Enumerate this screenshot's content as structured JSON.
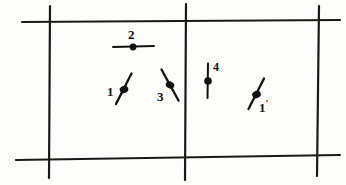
{
  "figure": {
    "title": "",
    "background_color": "#fdfdfc",
    "ink_color": "#1a1a1a",
    "width": 346,
    "height": 185
  },
  "grid": {
    "description": "Hand-drawn rectangular grid of two horizontal rules crossed by three vertical rules",
    "horizontal_lines": [
      {
        "name": "top-horizontal-line",
        "x1": 22,
        "y1": 22,
        "x2": 340,
        "y2": 20
      },
      {
        "name": "bottom-horizontal-line",
        "x1": 16,
        "y1": 160,
        "x2": 340,
        "y2": 155
      }
    ],
    "vertical_lines": [
      {
        "name": "left-vertical-line",
        "x1": 50,
        "y1": 6,
        "x2": 49,
        "y2": 178
      },
      {
        "name": "middle-vertical-line",
        "x1": 186,
        "y1": 4,
        "x2": 185,
        "y2": 180
      },
      {
        "name": "right-vertical-line",
        "x1": 319,
        "y1": 6,
        "x2": 317,
        "y2": 176
      }
    ]
  },
  "markers": [
    {
      "id": "marker-2",
      "label": "2",
      "orientation": "horizontal",
      "angle_deg": 90,
      "dot": {
        "cx": 133,
        "cy": 47
      },
      "stroke": {
        "x1": 113,
        "y1": 47,
        "x2": 154,
        "y2": 46
      },
      "label_pos": {
        "x": 128,
        "y": 28
      }
    },
    {
      "id": "marker-1",
      "label": "1",
      "orientation": "tilted-right",
      "angle_deg": 25,
      "dot": {
        "cx": 124,
        "cy": 90
      },
      "stroke": {
        "x1": 131,
        "y1": 74,
        "x2": 116,
        "y2": 104
      },
      "label_pos": {
        "x": 107,
        "y": 85
      }
    },
    {
      "id": "marker-3",
      "label": "3",
      "orientation": "tilted-left",
      "angle_deg": -25,
      "dot": {
        "cx": 170,
        "cy": 86
      },
      "stroke": {
        "x1": 162,
        "y1": 70,
        "x2": 178,
        "y2": 100
      },
      "label_pos": {
        "x": 158,
        "y": 90
      }
    },
    {
      "id": "marker-4",
      "label": "4",
      "orientation": "vertical",
      "angle_deg": 0,
      "dot": {
        "cx": 208,
        "cy": 81
      },
      "stroke": {
        "x1": 208,
        "y1": 64,
        "x2": 208,
        "y2": 98
      },
      "label_pos": {
        "x": 213,
        "y": 62
      }
    },
    {
      "id": "marker-1-prime",
      "label": "1",
      "label_suffix": "'",
      "orientation": "tilted-right",
      "angle_deg": 25,
      "dot": {
        "cx": 256,
        "cy": 95
      },
      "stroke": {
        "x1": 264,
        "y1": 79,
        "x2": 249,
        "y2": 109
      },
      "label_pos": {
        "x": 259,
        "y": 100
      }
    }
  ]
}
